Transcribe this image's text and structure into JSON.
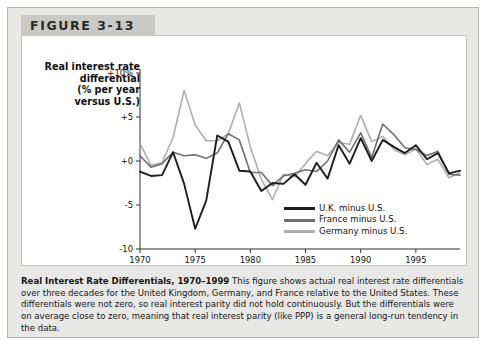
{
  "figure": {
    "header_label": "FIGURE 3-13",
    "axis_title_lines": [
      "Real interest rate",
      "differential",
      "(% per year",
      "versus U.S.)"
    ],
    "caption_title": "Real Interest Rate Differentials, 1970–1999",
    "caption_body": "This figure shows actual real interest rate differentials over three decades for the United Kingdom, Germany, and France relative to the United States. These differentials were not zero, so real interest parity did not hold continuously. But the differentials were on average close to zero, meaning that real interest parity (like PPP) is a general long-run tendency in the data."
  },
  "legend": {
    "items": [
      {
        "label": "U.K. minus U.S.",
        "color": "#1d1d1d"
      },
      {
        "label": "France minus U.S.",
        "color": "#6e6e6e"
      },
      {
        "label": "Germany minus U.S.",
        "color": "#aeaeae"
      }
    ]
  },
  "chart_data": {
    "type": "line",
    "title": "Real Interest Rate Differentials, 1970–1999",
    "xlabel": "",
    "ylabel": "Real interest rate differential (% per year versus U.S.)",
    "xlim": [
      1970,
      1999
    ],
    "ylim": [
      -10,
      10
    ],
    "ytick_labels": [
      "+10%",
      "+5",
      "+0",
      "-5",
      "-10"
    ],
    "ytick_values": [
      10,
      5,
      0,
      -5,
      -10
    ],
    "xtick_labels": [
      "1970",
      "1975",
      "1980",
      "1985",
      "1990",
      "1995"
    ],
    "xtick_values": [
      1970,
      1975,
      1980,
      1985,
      1990,
      1995
    ],
    "grid": false,
    "legend_position": "inside-bottom-right",
    "x": [
      1970,
      1971,
      1972,
      1973,
      1974,
      1975,
      1976,
      1977,
      1978,
      1979,
      1980,
      1981,
      1982,
      1983,
      1984,
      1985,
      1986,
      1987,
      1988,
      1989,
      1990,
      1991,
      1992,
      1993,
      1994,
      1995,
      1996,
      1997,
      1998,
      1999
    ],
    "series": [
      {
        "name": "U.K. minus U.S.",
        "color": "#1d1d1d",
        "values": [
          -1.2,
          -1.7,
          -1.6,
          1.0,
          -2.6,
          -7.7,
          -4.5,
          2.9,
          2.2,
          -1.1,
          -1.2,
          -3.4,
          -2.5,
          -2.6,
          -1.5,
          -2.7,
          -0.2,
          -2.0,
          1.8,
          -0.3,
          2.6,
          0.0,
          2.4,
          1.6,
          0.9,
          1.8,
          0.2,
          0.9,
          -1.4,
          -1.1
        ]
      },
      {
        "name": "France minus U.S.",
        "color": "#6e6e6e",
        "values": [
          0.6,
          -0.7,
          -0.3,
          1.0,
          0.6,
          0.7,
          0.3,
          0.9,
          3.1,
          2.4,
          -1.3,
          -1.3,
          -2.8,
          -1.7,
          -1.4,
          -1.0,
          -1.2,
          0.0,
          2.4,
          1.0,
          3.2,
          0.4,
          4.2,
          3.0,
          1.5,
          1.3,
          0.6,
          1.1,
          -1.5,
          -1.6
        ]
      },
      {
        "name": "Germany minus U.S.",
        "color": "#aeaeae",
        "values": [
          2.0,
          -0.5,
          -0.2,
          2.7,
          8.0,
          4.1,
          2.3,
          2.3,
          3.1,
          6.6,
          1.6,
          -2.1,
          -4.4,
          -1.5,
          -1.8,
          -0.3,
          1.1,
          0.6,
          2.1,
          1.9,
          5.2,
          2.2,
          2.8,
          1.3,
          0.7,
          1.4,
          -0.4,
          0.2,
          -1.9,
          -1.3
        ]
      }
    ]
  }
}
